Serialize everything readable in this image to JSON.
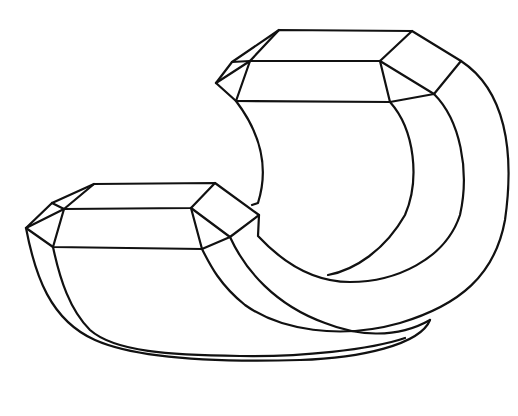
{
  "figure": {
    "background": "#ffffff",
    "stroke_color": "#111111",
    "stroke_width": 2.2
  }
}
